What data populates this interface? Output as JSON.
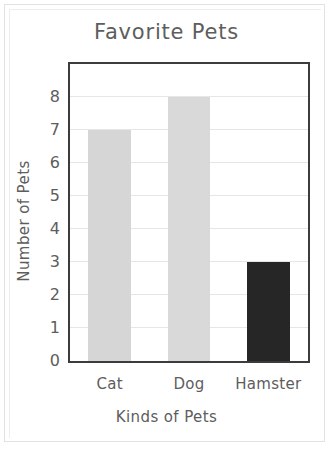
{
  "chart_data": {
    "type": "bar",
    "title": "Favorite Pets",
    "xlabel": "Kinds of Pets",
    "ylabel": "Number of Pets",
    "categories": [
      "Cat",
      "Dog",
      "Hamster"
    ],
    "values": [
      7,
      8,
      3
    ],
    "bar_colors": [
      "#d6d6d6",
      "#d9d9d9",
      "#262626"
    ],
    "ylim": [
      0,
      9
    ],
    "ytick_labels": [
      "0",
      "1",
      "2",
      "3",
      "4",
      "5",
      "6",
      "7",
      "8"
    ],
    "ytick_values": [
      0,
      1,
      2,
      3,
      4,
      5,
      6,
      7,
      8
    ],
    "grid": "horizontal",
    "legend": "none",
    "frame_color": "#3c3c3c",
    "gridline_color": "#e6e6e6",
    "text_color": "#5d5d5d",
    "background_color": "#ffffff"
  }
}
